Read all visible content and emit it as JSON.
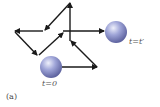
{
  "figure": {
    "panel_label": "(a)",
    "start_label": "t=0",
    "end_label": "t=t′",
    "colors": {
      "arrow": "#1a1a1a",
      "ball_light": "#dfe2f4",
      "ball_mid": "#9096cf",
      "ball_dark": "#5a5f9c",
      "background": "#ffffff"
    },
    "balls": [
      {
        "name": "start",
        "cx": 51,
        "cy": 67,
        "r": 11
      },
      {
        "name": "end",
        "cx": 116,
        "cy": 32,
        "r": 11
      }
    ],
    "path_segments": [
      {
        "from": [
          62,
          67
        ],
        "to": [
          97,
          67
        ]
      },
      {
        "from": [
          97,
          67
        ],
        "to": [
          71,
          41
        ]
      },
      {
        "from": [
          70,
          41
        ],
        "to": [
          70,
          3
        ]
      },
      {
        "from": [
          70,
          3
        ],
        "to": [
          45,
          30
        ]
      },
      {
        "from": [
          43,
          31
        ],
        "to": [
          15,
          31
        ]
      },
      {
        "from": [
          15,
          32
        ],
        "to": [
          37,
          55
        ]
      },
      {
        "from": [
          39,
          55
        ],
        "to": [
          63,
          33
        ]
      },
      {
        "from": [
          63,
          31
        ],
        "to": [
          104,
          31
        ]
      }
    ]
  }
}
